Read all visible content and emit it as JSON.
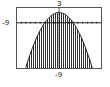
{
  "chart_data": {
    "type": "area",
    "title": "",
    "function": "y = 2 - 0.22x^2 (shaded region under curve)",
    "window": {
      "xmin": -9,
      "xmax": 9,
      "ymin": -9,
      "ymax": 3
    },
    "labels": {
      "ymax_label": "3",
      "xmin_label": "-9",
      "ymin_label": "-9"
    },
    "grid": false,
    "axis_ticks": true,
    "shading": "vertical lines",
    "peak": {
      "x": 0,
      "y": 2
    },
    "x_intercepts_at_ymin": [
      -7,
      7
    ]
  },
  "colors": {
    "curve": "#1a1a1a",
    "shade": "#333333",
    "frame": "#555555",
    "axis": "#222222",
    "background": "#ffffff"
  }
}
